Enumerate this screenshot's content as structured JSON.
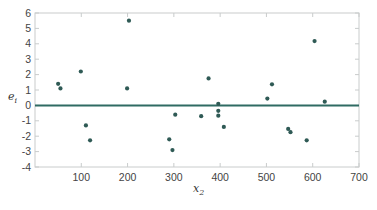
{
  "chart_data": {
    "type": "scatter",
    "title": "",
    "xlabel": "x_2",
    "ylabel": "e_i",
    "xlabel_main": "x",
    "xlabel_sub": "2",
    "ylabel_main": "e",
    "ylabel_sub": "i",
    "xlim": [
      0,
      700
    ],
    "ylim": [
      -4,
      6
    ],
    "x_ticks": [
      100,
      200,
      300,
      400,
      500,
      600,
      700
    ],
    "y_ticks": [
      -4,
      -3,
      -2,
      -1,
      0,
      1,
      2,
      3,
      4,
      5,
      6
    ],
    "grid": false,
    "legend": null,
    "reference_line": {
      "y": 0,
      "color": "#2f6b63"
    },
    "point_color": "#2f5a55",
    "frame_color": "#c9cccc",
    "series": [
      {
        "name": "residuals",
        "points": [
          [
            50,
            1.4
          ],
          [
            55,
            1.1
          ],
          [
            99,
            2.2
          ],
          [
            110,
            -1.3
          ],
          [
            119,
            -2.27
          ],
          [
            199,
            1.1
          ],
          [
            203,
            5.5
          ],
          [
            290,
            -2.2
          ],
          [
            297,
            -2.9
          ],
          [
            303,
            -0.6
          ],
          [
            359,
            -0.7
          ],
          [
            375,
            1.75
          ],
          [
            396,
            0.1
          ],
          [
            396,
            -0.35
          ],
          [
            396,
            -0.67
          ],
          [
            408,
            -1.4
          ],
          [
            502,
            0.44
          ],
          [
            512,
            1.37
          ],
          [
            547,
            -1.53
          ],
          [
            552,
            -1.74
          ],
          [
            587,
            -2.27
          ],
          [
            604,
            4.18
          ],
          [
            626,
            0.24
          ]
        ]
      }
    ]
  }
}
